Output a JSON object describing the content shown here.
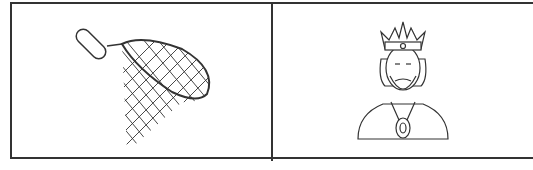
{
  "panels": [
    {
      "label": "fishing-net",
      "icon": "fishing-net-icon"
    },
    {
      "label": "king",
      "icon": "king-icon"
    }
  ],
  "colors": {
    "line": "#333333",
    "background": "#ffffff"
  }
}
